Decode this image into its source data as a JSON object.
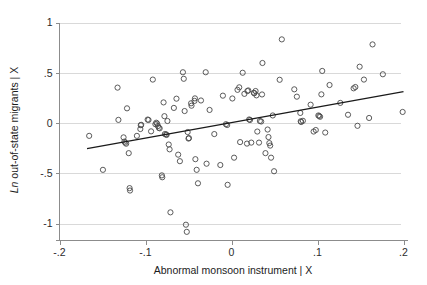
{
  "chart_data": {
    "type": "scatter",
    "title": "",
    "xlabel": "Abnormal monsoon instrument | X",
    "ylabel": "Ln out-of-state migrants | X",
    "ylabel_italic_prefix": "Ln",
    "ylabel_rest": " out-of-state migrants | X",
    "xlim": [
      -0.2,
      0.2
    ],
    "ylim": [
      -1.15,
      1.0
    ],
    "xticks": [
      -0.2,
      -0.1,
      0,
      0.1,
      0.2
    ],
    "xticklabels": [
      "-.2",
      "-.1",
      "0",
      ".1",
      ".2"
    ],
    "yticks": [
      1,
      0.5,
      0,
      -0.5,
      -1
    ],
    "yticklabels": [
      "1",
      ".5",
      "0",
      "-.5",
      "-1"
    ],
    "grid": "horizontal",
    "legend": "none",
    "marker": "open-circle",
    "marker_color": "#4a4a4a",
    "gridline_color": "#d9d9d9",
    "axis_color": "#8c8c8c",
    "fitline_color": "#1a1a1a",
    "fit_line": {
      "x_start": -0.168,
      "y_start": -0.255,
      "x_end": 0.2,
      "y_end": 0.312,
      "slope": 1.54,
      "intercept": 0.004
    },
    "points": [
      [
        -0.1655,
        -0.128
      ],
      [
        -0.1495,
        -0.466
      ],
      [
        -0.1325,
        0.352
      ],
      [
        -0.1315,
        0.031
      ],
      [
        -0.1255,
        -0.143
      ],
      [
        -0.1245,
        -0.185
      ],
      [
        -0.1235,
        -0.196
      ],
      [
        -0.1225,
        -0.206
      ],
      [
        -0.1215,
        0.146
      ],
      [
        -0.1195,
        -0.3
      ],
      [
        -0.1185,
        -0.648
      ],
      [
        -0.118,
        -0.672
      ],
      [
        -0.11,
        -0.128
      ],
      [
        -0.106,
        -0.06
      ],
      [
        -0.1055,
        -0.022
      ],
      [
        -0.105,
        -0.018
      ],
      [
        -0.0975,
        0.034
      ],
      [
        -0.0965,
        0.03
      ],
      [
        -0.0935,
        -0.083
      ],
      [
        -0.0915,
        0.432
      ],
      [
        -0.0885,
        -0.012
      ],
      [
        -0.0875,
        0.003
      ],
      [
        -0.0865,
        -0.006
      ],
      [
        -0.0855,
        -0.03
      ],
      [
        -0.0845,
        -0.048
      ],
      [
        -0.0835,
        -0.053
      ],
      [
        -0.081,
        -0.521
      ],
      [
        -0.0805,
        -0.54
      ],
      [
        -0.079,
        0.205
      ],
      [
        -0.078,
        0.068
      ],
      [
        -0.0775,
        -0.11
      ],
      [
        -0.076,
        -0.113
      ],
      [
        -0.0755,
        -0.119
      ],
      [
        -0.0745,
        0.02
      ],
      [
        -0.073,
        -0.214
      ],
      [
        -0.072,
        -0.262
      ],
      [
        -0.071,
        -0.889
      ],
      [
        -0.067,
        0.15
      ],
      [
        -0.064,
        0.242
      ],
      [
        -0.062,
        -0.315
      ],
      [
        -0.06,
        -0.38
      ],
      [
        -0.0565,
        0.505
      ],
      [
        -0.0555,
        0.44
      ],
      [
        -0.0545,
        0.119
      ],
      [
        -0.053,
        -1.012
      ],
      [
        -0.052,
        -1.083
      ],
      [
        -0.051,
        -0.09
      ],
      [
        -0.05,
        -0.155
      ],
      [
        -0.0495,
        -0.15
      ],
      [
        -0.047,
        0.196
      ],
      [
        -0.0465,
        0.172
      ],
      [
        -0.043,
        0.22
      ],
      [
        -0.0425,
        0.245
      ],
      [
        -0.042,
        -0.36
      ],
      [
        -0.0405,
        -0.466
      ],
      [
        -0.039,
        -0.6
      ],
      [
        -0.0355,
        0.224
      ],
      [
        -0.03,
        0.505
      ],
      [
        -0.029,
        -0.405
      ],
      [
        -0.0255,
        0.13
      ],
      [
        -0.02,
        -0.11
      ],
      [
        -0.013,
        -0.418
      ],
      [
        -0.01,
        0.272
      ],
      [
        -0.0065,
        -0.012
      ],
      [
        -0.005,
        -0.02
      ],
      [
        -0.0045,
        -0.615
      ],
      [
        0.001,
        0.244
      ],
      [
        0.003,
        -0.345
      ],
      [
        0.007,
        0.33
      ],
      [
        0.009,
        0.355
      ],
      [
        0.01,
        -0.19
      ],
      [
        0.013,
        0.5
      ],
      [
        0.015,
        0.29
      ],
      [
        0.018,
        -0.205
      ],
      [
        0.0185,
        0.318
      ],
      [
        0.0195,
        0.324
      ],
      [
        0.0205,
        0.035
      ],
      [
        0.0215,
        0.03
      ],
      [
        0.023,
        -0.195
      ],
      [
        0.026,
        0.3
      ],
      [
        0.0265,
        0.296
      ],
      [
        0.028,
        0.318
      ],
      [
        0.029,
        0.275
      ],
      [
        0.03,
        -0.085
      ],
      [
        0.032,
        -0.195
      ],
      [
        0.033,
        0.02
      ],
      [
        0.0345,
        0.015
      ],
      [
        0.0355,
        0.284
      ],
      [
        0.036,
        0.597
      ],
      [
        0.0395,
        -0.3
      ],
      [
        0.042,
        -0.065
      ],
      [
        0.043,
        -0.14
      ],
      [
        0.044,
        -0.2
      ],
      [
        0.045,
        -0.225
      ],
      [
        0.046,
        -0.345
      ],
      [
        0.048,
        0.075
      ],
      [
        0.0495,
        -0.48
      ],
      [
        0.056,
        0.43
      ],
      [
        0.0585,
        0.832
      ],
      [
        0.073,
        0.335
      ],
      [
        0.076,
        0.262
      ],
      [
        0.08,
        0.1
      ],
      [
        0.0805,
        0.017
      ],
      [
        0.081,
        0.01
      ],
      [
        0.083,
        0.022
      ],
      [
        0.092,
        0.182
      ],
      [
        0.0955,
        -0.085
      ],
      [
        0.098,
        -0.07
      ],
      [
        0.101,
        0.075
      ],
      [
        0.102,
        0.07
      ],
      [
        0.103,
        0.062
      ],
      [
        0.1045,
        0.285
      ],
      [
        0.1055,
        0.518
      ],
      [
        0.109,
        -0.095
      ],
      [
        0.114,
        0.378
      ],
      [
        0.1265,
        0.2
      ],
      [
        0.1355,
        0.082
      ],
      [
        0.142,
        0.345
      ],
      [
        0.144,
        0.358
      ],
      [
        0.1465,
        -0.028
      ],
      [
        0.149,
        0.56
      ],
      [
        0.154,
        0.432
      ],
      [
        0.16,
        0.05
      ],
      [
        0.164,
        0.782
      ],
      [
        0.176,
        0.485
      ],
      [
        0.199,
        0.11
      ]
    ]
  }
}
